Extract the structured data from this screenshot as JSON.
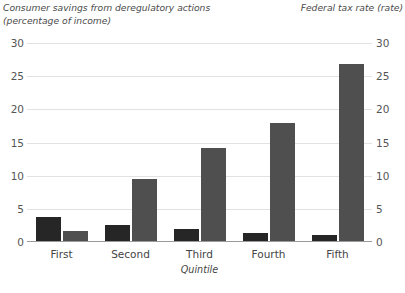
{
  "chart_data": {
    "type": "bar",
    "title": "",
    "categories": [
      "First",
      "Second",
      "Third",
      "Fourth",
      "Fifth"
    ],
    "series": [
      {
        "name": "Consumer savings from deregulatory actions (percentage of income)",
        "axis": "left",
        "color": "#262626",
        "values": [
          3.8,
          2.6,
          2.0,
          1.4,
          1.0
        ]
      },
      {
        "name": "Federal tax rate (rate)",
        "axis": "right",
        "color": "#4f4f4f",
        "values": [
          1.7,
          9.5,
          14.2,
          18.0,
          26.8
        ]
      }
    ],
    "xlabel": "Quintile",
    "ylabel_left": "Consumer savings from deregulatory actions\n(percentage of income)",
    "ylabel_right": "Federal tax rate (rate)",
    "ylim_left": [
      0,
      30
    ],
    "ylim_right": [
      0,
      30
    ],
    "yticks_left": [
      30,
      25,
      20,
      15,
      10,
      5,
      0
    ],
    "yticks_right": [
      30,
      25,
      20,
      15,
      10,
      5,
      0
    ],
    "grid": true,
    "legend": "none"
  },
  "source_note": ""
}
